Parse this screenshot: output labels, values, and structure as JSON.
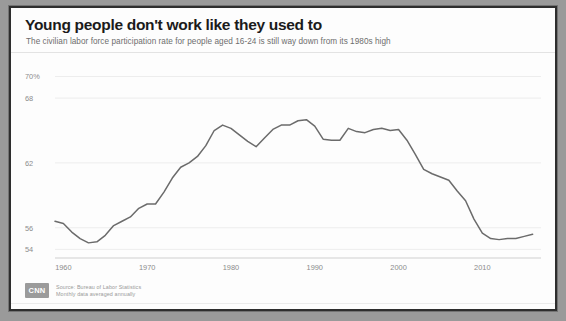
{
  "header": {
    "title": "Young people don't work like they used to",
    "subtitle": "The civilian labor force participation rate for people aged 16-24 is still way down from its 1980s high"
  },
  "footer": {
    "logo_text": "CNN",
    "source_line_1": "Source: Bureau of Labor Statistics",
    "source_line_2": "Monthly data averaged annually"
  },
  "style": {
    "line_color": "#6b6b6b",
    "grid_color": "#ededed",
    "axis_color": "#cfcfcf",
    "label_color": "#8c8c8c",
    "title_color": "#1b1b1b",
    "card_background": "#fdfdfd",
    "frame_color": "#2e2e2e",
    "page_background": "#9a9a9a"
  },
  "chart_data": {
    "type": "line",
    "title": "Young people don't work like they used to",
    "subtitle": "The civilian labor force participation rate for people aged 16-24 is still way down from its 1980s high",
    "xlabel": "",
    "ylabel": "",
    "xlim": [
      1959,
      2017
    ],
    "ylim": [
      53.2,
      70.6
    ],
    "grid": true,
    "legend": null,
    "y_ticks": [
      {
        "value": 70,
        "label": "70%"
      },
      {
        "value": 68,
        "label": "68"
      },
      {
        "value": 62,
        "label": "62"
      },
      {
        "value": 56,
        "label": "56"
      },
      {
        "value": 54,
        "label": "54"
      }
    ],
    "x_ticks": [
      {
        "value": 1960,
        "label": "1960"
      },
      {
        "value": 1970,
        "label": "1970"
      },
      {
        "value": 1980,
        "label": "1980"
      },
      {
        "value": 1990,
        "label": "1990"
      },
      {
        "value": 2000,
        "label": "2000"
      },
      {
        "value": 2010,
        "label": "2010"
      }
    ],
    "gridline_values": [
      70,
      68,
      62,
      56,
      54
    ],
    "series": [
      {
        "name": "Labor force participation rate, ages 16-24",
        "x": [
          1959,
          1960,
          1961,
          1962,
          1963,
          1964,
          1965,
          1966,
          1967,
          1968,
          1969,
          1970,
          1971,
          1972,
          1973,
          1974,
          1975,
          1976,
          1977,
          1978,
          1979,
          1980,
          1981,
          1982,
          1983,
          1984,
          1985,
          1986,
          1987,
          1988,
          1989,
          1990,
          1991,
          1992,
          1993,
          1994,
          1995,
          1996,
          1997,
          1998,
          1999,
          2000,
          2001,
          2002,
          2003,
          2004,
          2005,
          2006,
          2007,
          2008,
          2009,
          2010,
          2011,
          2012,
          2013,
          2014,
          2015,
          2016
        ],
        "values": [
          56.6,
          56.4,
          55.6,
          55.0,
          54.6,
          54.7,
          55.3,
          56.2,
          56.6,
          57.0,
          57.8,
          58.2,
          58.2,
          59.3,
          60.6,
          61.6,
          62.0,
          62.6,
          63.6,
          65.0,
          65.5,
          65.2,
          64.6,
          64.0,
          63.5,
          64.3,
          65.1,
          65.5,
          65.5,
          65.9,
          66.0,
          65.4,
          64.2,
          64.1,
          64.1,
          65.2,
          64.9,
          64.8,
          65.1,
          65.2,
          65.0,
          65.1,
          64.1,
          62.8,
          61.4,
          61.0,
          60.7,
          60.4,
          59.4,
          58.5,
          56.8,
          55.5,
          55.0,
          54.9,
          55.0,
          55.0,
          55.2,
          55.4
        ]
      }
    ],
    "annotations": [
      {
        "text": "peak around 1979 and late 1980s near 70%",
        "visible": false
      }
    ]
  }
}
